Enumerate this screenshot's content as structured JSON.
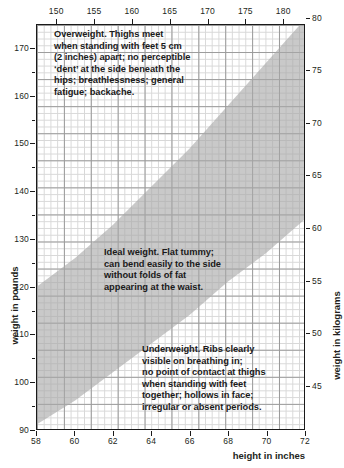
{
  "chart_data": {
    "type": "area",
    "title": "",
    "subtitle": "",
    "xlabel": "height in inches",
    "xlabel_top": "height in centimetres",
    "ylabel": "weight in pounds",
    "ylabel_right": "weight in kilograms",
    "xlim_inches": [
      58,
      72
    ],
    "xlim_cm": [
      147.32,
      182.88
    ],
    "ylim_pounds": [
      90,
      175
    ],
    "ylim_kilograms": [
      40.8,
      79.4
    ],
    "grid": true,
    "legend_position": "none",
    "x_ticks_bottom": [
      58,
      60,
      62,
      64,
      66,
      68,
      70,
      72
    ],
    "x_ticks_top": [
      150,
      155,
      160,
      165,
      170,
      175,
      180
    ],
    "y_ticks_left": [
      90,
      100,
      110,
      120,
      130,
      140,
      150,
      160,
      170
    ],
    "y_ticks_left_minor": [
      95,
      105,
      115,
      125,
      135,
      145,
      155,
      165
    ],
    "y_ticks_right": [
      45,
      50,
      55,
      60,
      65,
      70,
      75,
      80
    ],
    "series": [
      {
        "name": "ideal weight band upper bound",
        "x": [
          58,
          60,
          62,
          64,
          66,
          68,
          70,
          72
        ],
        "values": [
          120,
          126,
          133,
          141,
          149,
          158,
          167,
          176
        ]
      },
      {
        "name": "ideal weight band lower bound",
        "x": [
          58,
          60,
          62,
          64,
          66,
          68,
          70,
          72
        ],
        "values": [
          91,
          96,
          102,
          108,
          114,
          121,
          127,
          134
        ]
      }
    ],
    "band_color": "#a8a8a8",
    "annotations": [
      {
        "id": "overweight",
        "region": "above band",
        "text": "Overweight. Thighs meet\nwhen standing with feet 5 cm\n(2 inches) apart; no perceptible\n‘dent’ at the side beneath the\nhips; breathlessness; general\nfatigue; backache."
      },
      {
        "id": "ideal",
        "region": "inside band",
        "text": "Ideal weight. Flat tummy;\ncan bend easily to the side\nwithout folds of fat\nappearing at the waist."
      },
      {
        "id": "underweight",
        "region": "below band",
        "text": "Underweight. Ribs clearly\nvisible on breathing in;\nno point of contact at thighs\nwhen standing with feet\ntogether; hollows in face;\nirregular or absent periods."
      }
    ]
  },
  "colors": {
    "band": "#a8a8a8",
    "axis": "#1a1a1a",
    "grid_minor": "#d8d8d8",
    "grid_major": "#9a9a9a",
    "text": "#231f20"
  }
}
